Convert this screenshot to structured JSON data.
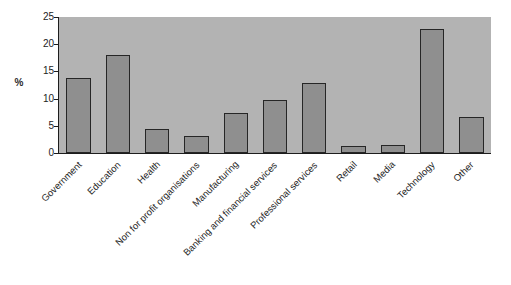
{
  "chart_data": {
    "type": "bar",
    "title": "",
    "subtitle": "",
    "xlabel": "",
    "ylabel": "%",
    "ylim": [
      0,
      25
    ],
    "yticks": [
      0,
      5,
      10,
      15,
      20,
      25
    ],
    "ytick_labels": [
      "0",
      "5",
      "10",
      "15",
      "20",
      "25"
    ],
    "grid": false,
    "legend": null,
    "orientation": "vertical",
    "categories": [
      "Government",
      "Education",
      "Health",
      "Non for profit organisations",
      "Manufacturing",
      "Banking and financial services",
      "Professional services",
      "Retail",
      "Media",
      "Technology",
      "Other"
    ],
    "values": [
      13.7,
      18.0,
      4.4,
      3.2,
      7.4,
      9.8,
      12.9,
      1.3,
      1.5,
      22.8,
      6.6
    ],
    "series": [
      {
        "name": "",
        "values": [
          13.7,
          18.0,
          4.4,
          3.2,
          7.4,
          9.8,
          12.9,
          1.3,
          1.5,
          22.8,
          6.6
        ]
      }
    ],
    "annotations": [],
    "colors": {
      "bar_fill": "#8f8f8f",
      "bar_border": "#262626",
      "plot_background": "#b3b3b3",
      "figure_background": "#ffffff",
      "axis": "#1d1d1d",
      "text": "#1f1f1f"
    },
    "label_rotation_degrees": -45
  }
}
